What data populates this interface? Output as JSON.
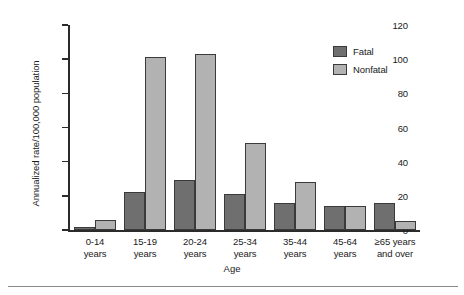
{
  "chart_data": {
    "type": "bar",
    "title": "",
    "xlabel": "Age",
    "ylabel": "Annualized rate/100,000 population",
    "ylim": [
      0,
      120
    ],
    "yticks": [
      0,
      20,
      40,
      60,
      80,
      100,
      120
    ],
    "grid": false,
    "legend_position": "top-right",
    "categories": [
      "0-14\nyears",
      "15-19\nyears",
      "20-24\nyears",
      "25-34\nyears",
      "35-44\nyears",
      "45-64\nyears",
      "≥65 years\nand over"
    ],
    "category_lines": [
      [
        "0-14",
        "years"
      ],
      [
        "15-19",
        "years"
      ],
      [
        "20-24",
        "years"
      ],
      [
        "25-34",
        "years"
      ],
      [
        "35-44",
        "years"
      ],
      [
        "45-64",
        "years"
      ],
      [
        "≥65 years",
        "and over"
      ]
    ],
    "series": [
      {
        "name": "Fatal",
        "color": "#6f6f6f",
        "values": [
          2,
          22,
          29,
          21,
          16,
          14,
          16
        ]
      },
      {
        "name": "Nonfatal",
        "color": "#b2b2b2",
        "values": [
          6,
          101,
          103,
          51,
          28,
          14,
          5
        ]
      }
    ]
  },
  "legend": {
    "items": [
      {
        "label": "Fatal"
      },
      {
        "label": "Nonfatal"
      }
    ]
  },
  "colors": {
    "fatal": "#6f6f6f",
    "nonfatal": "#b2b2b2",
    "axis": "#2b2b2b",
    "rule": "#8a8a8a"
  }
}
